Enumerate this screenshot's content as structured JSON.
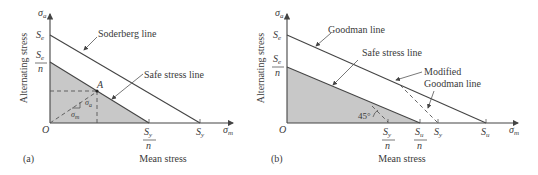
{
  "panel_a": {
    "tag": "(a)",
    "y_axis_symbol": "σ",
    "y_axis_sub": "a",
    "x_axis_symbol": "σ",
    "x_axis_sub": "m",
    "y_axis_title": "Alternating stress",
    "x_axis_title": "Mean stress",
    "origin": "O",
    "y_ticks": [
      {
        "main": "S",
        "sub": "e",
        "over_n": false
      },
      {
        "main": "S",
        "sub": "e",
        "over_n": true,
        "denom": "n"
      }
    ],
    "x_ticks": [
      {
        "main": "S",
        "sub": "y",
        "over_n": true,
        "denom": "n"
      },
      {
        "main": "S",
        "sub": "y",
        "over_n": false
      }
    ],
    "lines": {
      "soderberg": "Soderberg line",
      "safe": "Safe stress line"
    },
    "point_label": "A",
    "component_a": {
      "main": "σ",
      "sub": "a"
    },
    "component_m": {
      "main": "σ",
      "sub": "m"
    }
  },
  "panel_b": {
    "tag": "(b)",
    "y_axis_symbol": "σ",
    "y_axis_sub": "a",
    "x_axis_symbol": "σ",
    "x_axis_sub": "m",
    "y_axis_title": "Alternating stress",
    "x_axis_title": "Mean stress",
    "origin": "O",
    "y_ticks": [
      {
        "main": "S",
        "sub": "e",
        "over_n": false
      },
      {
        "main": "S",
        "sub": "e",
        "over_n": true,
        "denom": "n"
      }
    ],
    "x_ticks": [
      {
        "main": "S",
        "sub": "y",
        "over_n": true,
        "denom": "n"
      },
      {
        "main": "S",
        "sub": "u",
        "over_n": true,
        "denom": "n"
      },
      {
        "main": "S",
        "sub": "y",
        "over_n": false
      },
      {
        "main": "S",
        "sub": "u",
        "over_n": false
      }
    ],
    "lines": {
      "goodman": "Goodman line",
      "safe": "Safe stress line",
      "modified_1": "Modified",
      "modified_2": "Goodman line"
    },
    "angle_label": "45°"
  },
  "colors": {
    "shaded_region": "#c8c8c8",
    "line": "#444444",
    "text": "#3a3a3a"
  }
}
